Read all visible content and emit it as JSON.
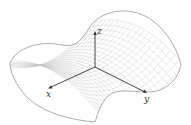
{
  "figure": {
    "type": "saddle-surface",
    "axes": {
      "x_label": "x",
      "y_label": "y",
      "z_label": "z"
    },
    "colors": {
      "mesh": "#c4c4c4",
      "edge": "#8a8a8a",
      "axis": "#333333"
    }
  }
}
